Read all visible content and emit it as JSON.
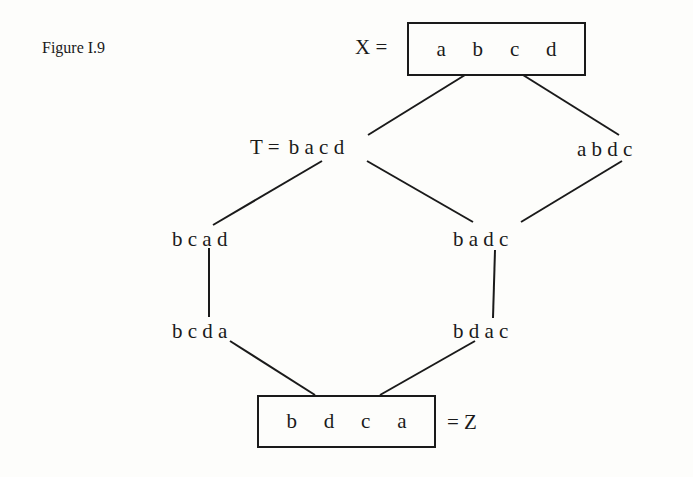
{
  "figure": {
    "caption": "Figure I.9"
  },
  "nodes": {
    "x": {
      "label": "X =",
      "letters": [
        "a",
        "b",
        "c",
        "d"
      ]
    },
    "t": {
      "label": "T =",
      "value": "b a c d"
    },
    "abdc": {
      "value": "a b d c"
    },
    "bcad": {
      "value": "b c a d"
    },
    "badc": {
      "value": "b a d c"
    },
    "bcda": {
      "value": "b c d a"
    },
    "bdac": {
      "value": "b d a c"
    },
    "z": {
      "label": "= Z",
      "letters": [
        "b",
        "d",
        "c",
        "a"
      ]
    }
  },
  "edges": [
    {
      "from": "X",
      "to": "T"
    },
    {
      "from": "X",
      "to": "abdc"
    },
    {
      "from": "T",
      "to": "bcad"
    },
    {
      "from": "T",
      "to": "badc"
    },
    {
      "from": "abdc",
      "to": "badc"
    },
    {
      "from": "bcad",
      "to": "bcda"
    },
    {
      "from": "badc",
      "to": "bdac"
    },
    {
      "from": "bcda",
      "to": "Z"
    },
    {
      "from": "bdac",
      "to": "Z"
    }
  ],
  "colors": {
    "ink": "#1a1a1a",
    "paper": "#fdfdfb"
  }
}
